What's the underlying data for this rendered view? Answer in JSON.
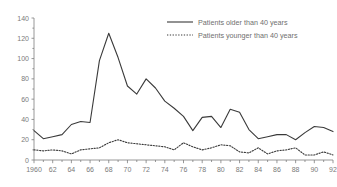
{
  "chart_data": {
    "type": "line",
    "title": "",
    "xlabel": "",
    "ylabel": "",
    "xlim": [
      1960,
      1992
    ],
    "ylim": [
      0,
      140
    ],
    "grid": false,
    "legend_position": "top-right",
    "x": [
      1960,
      1961,
      1962,
      1963,
      1964,
      1965,
      1966,
      1967,
      1968,
      1969,
      1970,
      1971,
      1972,
      1973,
      1974,
      1975,
      1976,
      1977,
      1978,
      1979,
      1980,
      1981,
      1982,
      1983,
      1984,
      1985,
      1986,
      1987,
      1988,
      1989,
      1990,
      1991,
      1992
    ],
    "x_tick_labels": [
      "1960",
      "62",
      "64",
      "66",
      "68",
      "70",
      "72",
      "74",
      "76",
      "78",
      "80",
      "82",
      "84",
      "86",
      "88",
      "90",
      "92"
    ],
    "x_tick_values": [
      1960,
      1962,
      1964,
      1966,
      1968,
      1970,
      1972,
      1974,
      1976,
      1978,
      1980,
      1982,
      1984,
      1986,
      1988,
      1990,
      1992
    ],
    "y_tick_labels": [
      "0",
      "20",
      "40",
      "60",
      "80",
      "100",
      "120",
      "140"
    ],
    "y_tick_values": [
      0,
      20,
      40,
      60,
      80,
      100,
      120,
      140
    ],
    "series": [
      {
        "name": "Patients older than 40 years",
        "style": "solid",
        "color": "#3a3a3a",
        "values": [
          29,
          21,
          23,
          25,
          35,
          38,
          37,
          98,
          125,
          101,
          73,
          65,
          80,
          71,
          58,
          51,
          43,
          29,
          42,
          43,
          32,
          50,
          47,
          30,
          21,
          23,
          25,
          25,
          20,
          27,
          33,
          32,
          28
        ]
      },
      {
        "name": "Patients younger than 40 years",
        "style": "dotted",
        "color": "#3a3a3a",
        "values": [
          10,
          9,
          10,
          9,
          6,
          10,
          11,
          12,
          17,
          20,
          17,
          16,
          15,
          14,
          13,
          10,
          17,
          13,
          10,
          12,
          15,
          14,
          8,
          7,
          12,
          6,
          9,
          10,
          12,
          5,
          5,
          8,
          5
        ]
      }
    ]
  },
  "legend": {
    "items": [
      {
        "label": "Patients older than 40 years",
        "style": "solid"
      },
      {
        "label": "Patients younger than 40 years",
        "style": "dotted"
      }
    ]
  }
}
